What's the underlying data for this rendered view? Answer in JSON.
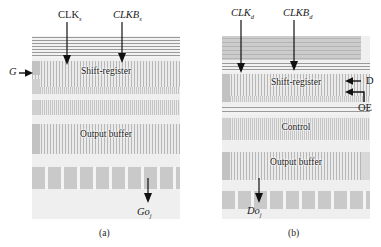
{
  "figure": {
    "caption_a": "(a)",
    "caption_b": "(b)"
  },
  "panel_a": {
    "signals": {
      "clk": "CLK",
      "clk_sub": "s",
      "clkb": "CLKB",
      "clkb_sub": "s",
      "gate_in": "G",
      "output": "Go",
      "output_sub": "j"
    },
    "blocks": [
      {
        "label": "Shift-register"
      },
      {
        "label": "Output buffer"
      }
    ]
  },
  "panel_b": {
    "signals": {
      "clk": "CLK",
      "clk_sub": "d",
      "clkb": "CLKB",
      "clkb_sub": "d",
      "data_in": "D",
      "output_enable": "OE",
      "output": "Do",
      "output_sub": "j"
    },
    "blocks": [
      {
        "label": "Shift-register"
      },
      {
        "label": "Control"
      },
      {
        "label": "Output buffer"
      }
    ]
  },
  "colors": {
    "background": "#ffffff",
    "ink": "#1a1a1a",
    "die": "#efefef",
    "bus_line": "#9a9a9a",
    "pad": "#c9c9c9",
    "rail": "#c2c2c2"
  }
}
